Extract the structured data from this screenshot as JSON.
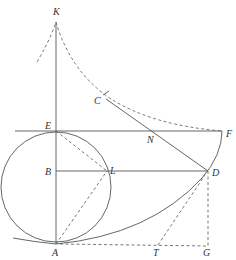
{
  "diagram": {
    "type": "geometric-construction",
    "points": {
      "K": {
        "label": "K",
        "x": 56,
        "y": 20
      },
      "C": {
        "label": "C",
        "x": 106,
        "y": 101
      },
      "E": {
        "label": "E",
        "x": 56,
        "y": 131
      },
      "N": {
        "label": "N",
        "x": 155,
        "y": 131
      },
      "F": {
        "label": "F",
        "x": 222,
        "y": 131
      },
      "B": {
        "label": "B",
        "x": 56,
        "y": 171
      },
      "L": {
        "label": "L",
        "x": 107,
        "y": 171
      },
      "D": {
        "label": "D",
        "x": 208,
        "y": 171
      },
      "A": {
        "label": "A",
        "x": 56,
        "y": 244
      },
      "T": {
        "label": "T",
        "x": 158,
        "y": 245
      },
      "G": {
        "label": "G",
        "x": 208,
        "y": 245
      }
    },
    "circle": {
      "cx": 56,
      "cy": 187,
      "r": 56
    }
  }
}
